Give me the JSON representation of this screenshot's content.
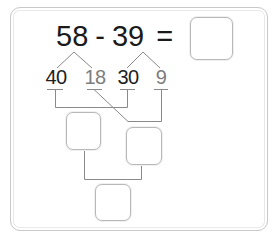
{
  "problem": {
    "left_operand": "58",
    "operator": "-",
    "right_operand": "39",
    "equals": "=",
    "answer": ""
  },
  "decomposition": {
    "left_parts": [
      {
        "value": "40",
        "style": "dark"
      },
      {
        "value": "18",
        "style": "light"
      }
    ],
    "right_parts": [
      {
        "value": "30",
        "style": "dark"
      },
      {
        "value": "9",
        "style": "light"
      }
    ]
  },
  "boxes": {
    "answer_box": "",
    "tens_difference_box": "",
    "ones_difference_box": "",
    "final_sum_box": ""
  },
  "colors": {
    "text_dark": "#1e1e1e",
    "text_light": "#7d7d7d",
    "line": "#8a8a8a",
    "box_border": "#b8b8b8",
    "frame_border": "#c9c9c9"
  }
}
